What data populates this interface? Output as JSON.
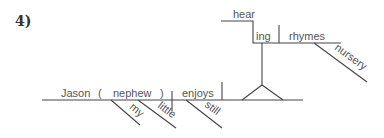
{
  "problem_number": "4)",
  "diagram": {
    "sentence_type": "Reed-Kellogg sentence diagram",
    "main_line": {
      "subject": "Jason",
      "appositive_open": "(",
      "appositive": "nephew",
      "appositive_close": ")",
      "verb": "enjoys"
    },
    "modifiers": {
      "nephew_1": "my",
      "nephew_2": "little",
      "verb": "still",
      "object_of_gerund": "nursery"
    },
    "gerund_phrase": {
      "gerund_stem": "hear",
      "gerund_suffix": "ing",
      "object": "rhymes"
    },
    "line_color": "#444444",
    "text_color": "#555555"
  }
}
